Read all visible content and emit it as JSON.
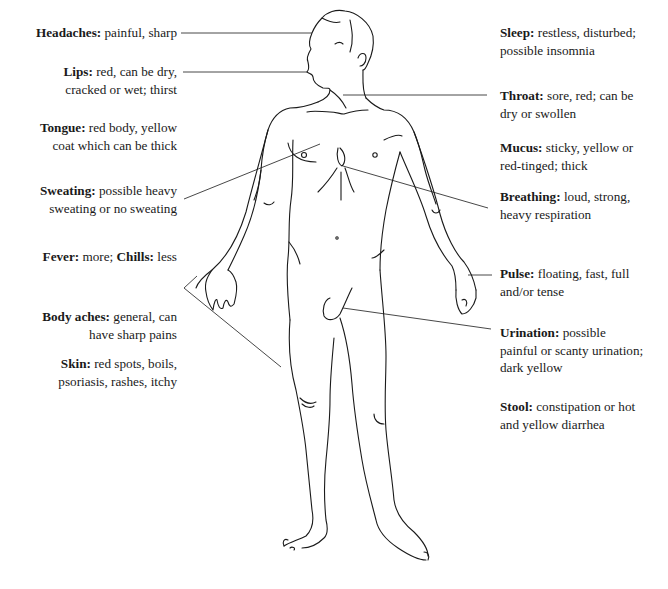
{
  "diagram": {
    "line_color": "#1a1a1a",
    "background": "#ffffff"
  },
  "left_labels": [
    {
      "term": "Headaches:",
      "desc": "painful, sharp"
    },
    {
      "term": "Lips:",
      "desc": "red, can be dry,",
      "desc2": "cracked or wet; thirst"
    },
    {
      "term": "Tongue:",
      "desc": "red body, yellow",
      "desc2": "coat which can be thick"
    },
    {
      "term": "Sweating:",
      "desc": "possible heavy",
      "desc2": "sweating or no sweating"
    },
    {
      "term": "Fever:",
      "desc": "more;",
      "term2": "Chills:",
      "desc2": "less"
    },
    {
      "term": "Body aches:",
      "desc": "general, can",
      "desc2": "have sharp pains"
    },
    {
      "term": "Skin:",
      "desc": "red spots, boils,",
      "desc2": "psoriasis, rashes, itchy"
    }
  ],
  "right_labels": [
    {
      "term": "Sleep:",
      "desc": "restless, disturbed;",
      "desc2": "possible insomnia"
    },
    {
      "term": "Throat:",
      "desc": "sore, red; can be",
      "desc2": "dry or swollen"
    },
    {
      "term": "Mucus:",
      "desc": "sticky, yellow or",
      "desc2": "red-tinged; thick"
    },
    {
      "term": "Breathing:",
      "desc": "loud, strong,",
      "desc2": "heavy respiration"
    },
    {
      "term": "Pulse:",
      "desc": "floating, fast, full",
      "desc2": "and/or tense"
    },
    {
      "term": "Urination:",
      "desc": "possible",
      "desc2": "painful or scanty urination;",
      "desc3": "dark yellow"
    },
    {
      "term": "Stool:",
      "desc": "constipation or hot",
      "desc2": "and yellow diarrhea"
    }
  ]
}
